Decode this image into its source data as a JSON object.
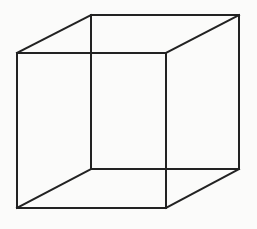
{
  "diagram": {
    "type": "wireframe-cube",
    "background": "#fbfbfa",
    "stroke_color": "#222222",
    "stroke_width": 2,
    "front_face": {
      "x1": 17,
      "y1": 53,
      "x2": 166,
      "y2": 208
    },
    "back_face": {
      "x1": 91,
      "y1": 15,
      "x2": 239,
      "y2": 169
    },
    "edges": [
      {
        "name": "front-top",
        "x1": 17,
        "y1": 53,
        "x2": 166,
        "y2": 53
      },
      {
        "name": "front-bottom",
        "x1": 17,
        "y1": 208,
        "x2": 166,
        "y2": 208
      },
      {
        "name": "front-left",
        "x1": 17,
        "y1": 53,
        "x2": 17,
        "y2": 208
      },
      {
        "name": "front-right",
        "x1": 166,
        "y1": 53,
        "x2": 166,
        "y2": 208
      },
      {
        "name": "back-top",
        "x1": 91,
        "y1": 15,
        "x2": 239,
        "y2": 15
      },
      {
        "name": "back-bottom",
        "x1": 91,
        "y1": 169,
        "x2": 239,
        "y2": 169
      },
      {
        "name": "back-left",
        "x1": 91,
        "y1": 15,
        "x2": 91,
        "y2": 169
      },
      {
        "name": "back-right",
        "x1": 239,
        "y1": 15,
        "x2": 239,
        "y2": 169
      },
      {
        "name": "connector-top-left",
        "x1": 17,
        "y1": 53,
        "x2": 91,
        "y2": 15
      },
      {
        "name": "connector-top-right",
        "x1": 166,
        "y1": 53,
        "x2": 239,
        "y2": 15
      },
      {
        "name": "connector-bottom-left",
        "x1": 17,
        "y1": 208,
        "x2": 91,
        "y2": 169
      },
      {
        "name": "connector-bottom-right",
        "x1": 166,
        "y1": 208,
        "x2": 239,
        "y2": 169
      }
    ]
  }
}
